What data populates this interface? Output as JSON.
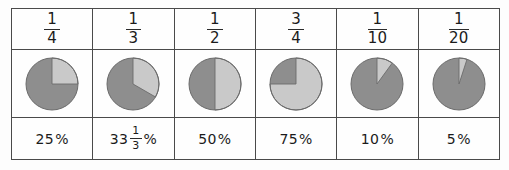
{
  "diagram": {
    "colors": {
      "pie_dark": "#8e8e8e",
      "pie_light": "#c9c9c9",
      "pie_outline": "#6b6b6b",
      "border": "#4a4a4a",
      "frame": "#3b3b3b",
      "background": "#fdfdfd",
      "text": "#1b1b1b"
    },
    "columns": [
      {
        "id": "one-quarter",
        "fraction": {
          "numerator": "1",
          "denominator": "4"
        },
        "percent": {
          "whole": "25",
          "numerator": "",
          "denominator": "",
          "symbol": "%"
        },
        "pie": {
          "shaded_fraction": 0.25,
          "start_angle_deg": 0,
          "sweep_deg": 90
        }
      },
      {
        "id": "one-third",
        "fraction": {
          "numerator": "1",
          "denominator": "3"
        },
        "percent": {
          "whole": "33",
          "numerator": "1",
          "denominator": "3",
          "symbol": "%"
        },
        "pie": {
          "shaded_fraction": 0.3333,
          "start_angle_deg": 0,
          "sweep_deg": 120
        }
      },
      {
        "id": "one-half",
        "fraction": {
          "numerator": "1",
          "denominator": "2"
        },
        "percent": {
          "whole": "50",
          "numerator": "",
          "denominator": "",
          "symbol": "%"
        },
        "pie": {
          "shaded_fraction": 0.5,
          "start_angle_deg": 0,
          "sweep_deg": 180
        }
      },
      {
        "id": "three-quarters",
        "fraction": {
          "numerator": "3",
          "denominator": "4"
        },
        "percent": {
          "whole": "75",
          "numerator": "",
          "denominator": "",
          "symbol": "%"
        },
        "pie": {
          "shaded_fraction": 0.75,
          "start_angle_deg": 0,
          "sweep_deg": 270
        }
      },
      {
        "id": "one-tenth",
        "fraction": {
          "numerator": "1",
          "denominator": "10"
        },
        "percent": {
          "whole": "10",
          "numerator": "",
          "denominator": "",
          "symbol": "%"
        },
        "pie": {
          "shaded_fraction": 0.1,
          "start_angle_deg": 0,
          "sweep_deg": 36
        }
      },
      {
        "id": "one-twentieth",
        "fraction": {
          "numerator": "1",
          "denominator": "20"
        },
        "percent": {
          "whole": "5",
          "numerator": "",
          "denominator": "",
          "symbol": "%"
        },
        "pie": {
          "shaded_fraction": 0.05,
          "start_angle_deg": 0,
          "sweep_deg": 18
        }
      }
    ]
  }
}
